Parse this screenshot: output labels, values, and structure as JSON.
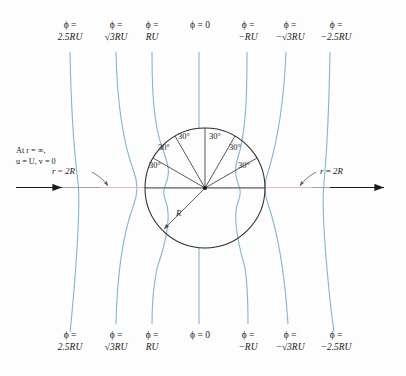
{
  "figure": {
    "type": "potential-flow-around-cylinder",
    "background": "#fdfdfd",
    "streamline_color": "#7fb6d4",
    "outline_color": "#2b2b2b",
    "accent_color": "#c0299b",
    "axis_color": "#8a8a8a"
  },
  "annotations": {
    "freestream_line1": "At r = ∞,",
    "freestream_line2": "u = U, v = 0",
    "left_r2R_prefix": "r",
    "left_r2R_eq": "=",
    "left_r2R_value": "2R",
    "right_r2R_prefix": "r",
    "right_r2R_eq": "=",
    "right_r2R_value": "2R",
    "radius_label": "R"
  },
  "angle_labels": [
    {
      "text": "30°",
      "x": 152,
      "y": 166
    },
    {
      "text": "30°",
      "x": 161,
      "y": 148
    },
    {
      "text": "30°",
      "x": 180,
      "y": 137
    },
    {
      "text": "30°",
      "x": 211,
      "y": 137
    },
    {
      "text": "30°",
      "x": 231,
      "y": 148
    },
    {
      "text": "30°",
      "x": 240,
      "y": 166
    }
  ],
  "potential_labels": {
    "top_y": 20,
    "bottom_y": 330,
    "items": [
      {
        "id": "phi-2p5RU",
        "line1": "ϕ =",
        "line2": "2.5RU",
        "sqrt": false,
        "neg": false,
        "x": 70,
        "value": "2.5RU",
        "curve_top_x": 70
      },
      {
        "id": "phi-sqrt3RU",
        "line1": "ϕ =",
        "line2": "√3RU",
        "sqrt": true,
        "neg": false,
        "x": 116,
        "value": "√3RU",
        "curve_top_x": 116
      },
      {
        "id": "phi-RU",
        "line1": "ϕ =",
        "line2": "RU",
        "sqrt": false,
        "neg": false,
        "x": 152,
        "value": "RU",
        "curve_top_x": 152
      },
      {
        "id": "phi-0",
        "line1": "ϕ = 0",
        "line2": "",
        "sqrt": false,
        "neg": false,
        "x": 200,
        "value": "0",
        "curve_top_x": 199
      },
      {
        "id": "phi-negRU",
        "line1": "ϕ =",
        "line2": "−RU",
        "sqrt": false,
        "neg": true,
        "x": 248,
        "value": "−RU",
        "curve_top_x": 247
      },
      {
        "id": "phi-negsqrt3RU",
        "line1": "ϕ =",
        "line2": "−√3RU",
        "sqrt": true,
        "neg": true,
        "x": 290,
        "value": "−√3RU",
        "curve_top_x": 286
      },
      {
        "id": "phi-neg2p5RU",
        "line1": "ϕ =",
        "line2": "−2.5RU",
        "sqrt": false,
        "neg": true,
        "x": 336,
        "value": "−2.5RU",
        "curve_top_x": 330
      }
    ]
  },
  "geometry": {
    "center_x": 205,
    "center_y": 188,
    "radius": 60,
    "sector_count": 6,
    "sector_degrees": 30
  }
}
